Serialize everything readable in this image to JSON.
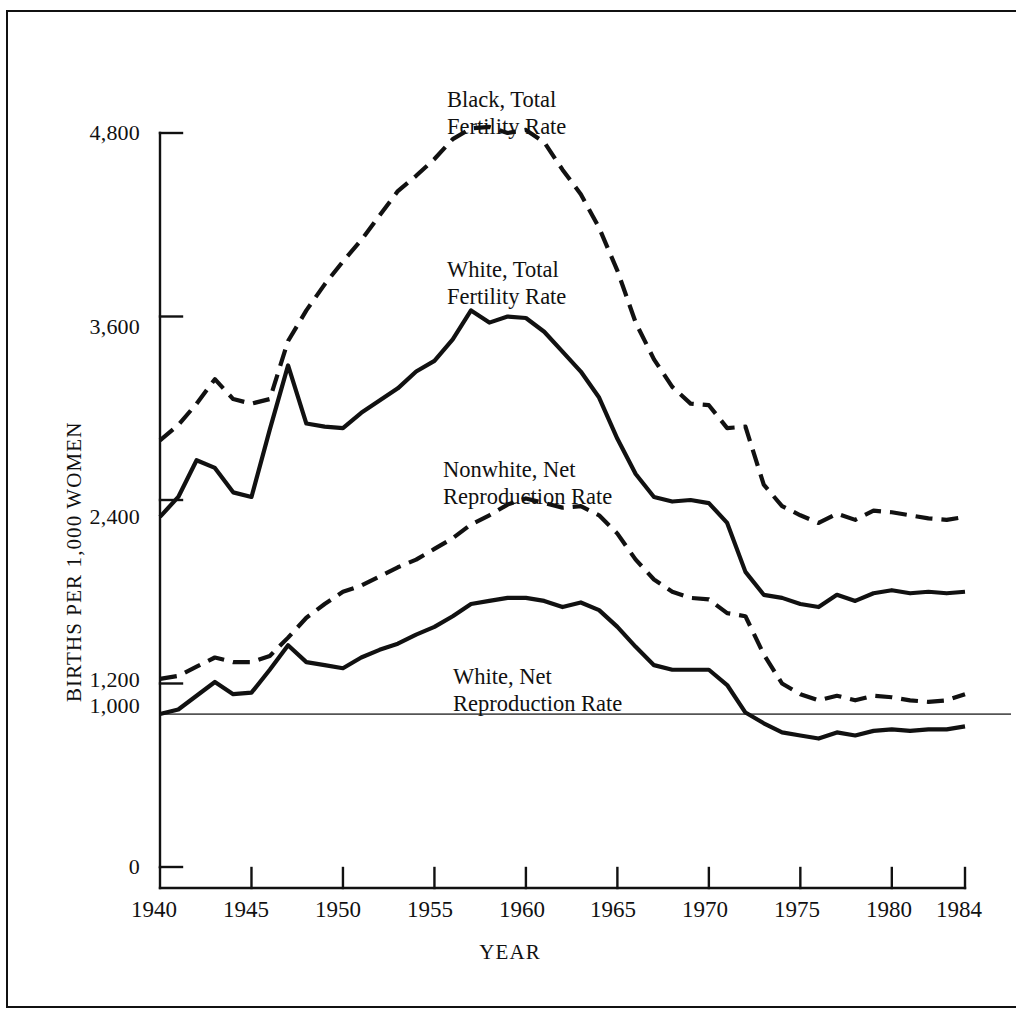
{
  "chart_data": {
    "type": "line",
    "title": "",
    "xlabel": "YEAR",
    "ylabel": "BIRTHS PER 1,000 WOMEN",
    "xlim": [
      1940,
      1984
    ],
    "ylim": [
      0,
      5000
    ],
    "grid": false,
    "legend_position": "inline-annotations",
    "y_ticks": [
      "4,800",
      "3,600",
      "2,400",
      "1,200",
      "1,000",
      "0"
    ],
    "y_tick_values": [
      4800,
      3600,
      2400,
      1200,
      1000,
      0
    ],
    "x_ticks": [
      "1940",
      "1945",
      "1950",
      "1955",
      "1960",
      "1965",
      "1970",
      "1975",
      "1980",
      "1984"
    ],
    "x_tick_values": [
      1940,
      1945,
      1950,
      1955,
      1960,
      1965,
      1970,
      1975,
      1980,
      1984
    ],
    "reference_line": {
      "value": 1000,
      "label": "1,000"
    },
    "x": [
      1940,
      1941,
      1942,
      1943,
      1944,
      1945,
      1946,
      1947,
      1948,
      1949,
      1950,
      1951,
      1952,
      1953,
      1954,
      1955,
      1956,
      1957,
      1958,
      1959,
      1960,
      1961,
      1962,
      1963,
      1964,
      1965,
      1966,
      1967,
      1968,
      1969,
      1970,
      1971,
      1972,
      1973,
      1974,
      1975,
      1976,
      1977,
      1978,
      1979,
      1980,
      1981,
      1982,
      1983,
      1984
    ],
    "series": [
      {
        "name": "Black, Total Fertility Rate",
        "style": "dashed",
        "color": "#111111",
        "values": [
          2790,
          2890,
          3030,
          3190,
          3060,
          3030,
          3060,
          3440,
          3640,
          3810,
          3960,
          4100,
          4260,
          4420,
          4520,
          4630,
          4760,
          4830,
          4840,
          4800,
          4820,
          4740,
          4560,
          4400,
          4180,
          3900,
          3560,
          3320,
          3140,
          3030,
          3020,
          2870,
          2880,
          2500,
          2360,
          2300,
          2250,
          2310,
          2270,
          2330,
          2320,
          2300,
          2280,
          2270,
          2290
        ]
      },
      {
        "name": "White, Total Fertility Rate",
        "style": "solid",
        "color": "#111111",
        "values": [
          2290,
          2420,
          2660,
          2610,
          2450,
          2420,
          2860,
          3280,
          2900,
          2880,
          2870,
          2970,
          3050,
          3130,
          3240,
          3310,
          3450,
          3640,
          3560,
          3600,
          3590,
          3500,
          3370,
          3240,
          3070,
          2800,
          2570,
          2420,
          2390,
          2400,
          2380,
          2250,
          1930,
          1780,
          1760,
          1720,
          1700,
          1780,
          1740,
          1790,
          1810,
          1790,
          1800,
          1790,
          1800
        ]
      },
      {
        "name": "Nonwhite, Net Reproduction Rate",
        "style": "dashed",
        "color": "#111111",
        "values": [
          1230,
          1250,
          1310,
          1370,
          1340,
          1340,
          1380,
          1500,
          1630,
          1720,
          1800,
          1840,
          1900,
          1960,
          2010,
          2080,
          2150,
          2240,
          2300,
          2370,
          2410,
          2380,
          2350,
          2360,
          2300,
          2180,
          2010,
          1880,
          1800,
          1760,
          1750,
          1660,
          1640,
          1390,
          1200,
          1130,
          1090,
          1120,
          1090,
          1120,
          1110,
          1090,
          1080,
          1090,
          1130
        ]
      },
      {
        "name": "White, Net Reproduction Rate",
        "style": "solid",
        "color": "#111111",
        "values": [
          1000,
          1030,
          1120,
          1210,
          1130,
          1140,
          1290,
          1450,
          1340,
          1320,
          1300,
          1370,
          1420,
          1460,
          1520,
          1570,
          1640,
          1720,
          1740,
          1760,
          1760,
          1740,
          1700,
          1730,
          1680,
          1570,
          1440,
          1320,
          1290,
          1290,
          1290,
          1190,
          1010,
          940,
          880,
          860,
          840,
          880,
          860,
          890,
          900,
          890,
          900,
          900,
          920
        ]
      }
    ],
    "annotations": [
      {
        "id": "black-tfr",
        "text": "Black, Total\nFertility Rate",
        "x": 447,
        "y": 86
      },
      {
        "id": "white-tfr",
        "text": "White, Total\nFertility Rate",
        "x": 447,
        "y": 256
      },
      {
        "id": "nonwhite-nrr",
        "text": "Nonwhite, Net\nReproduction Rate",
        "x": 443,
        "y": 456
      },
      {
        "id": "white-nrr",
        "text": "White, Net\nReproduction Rate",
        "x": 453,
        "y": 663
      }
    ]
  }
}
